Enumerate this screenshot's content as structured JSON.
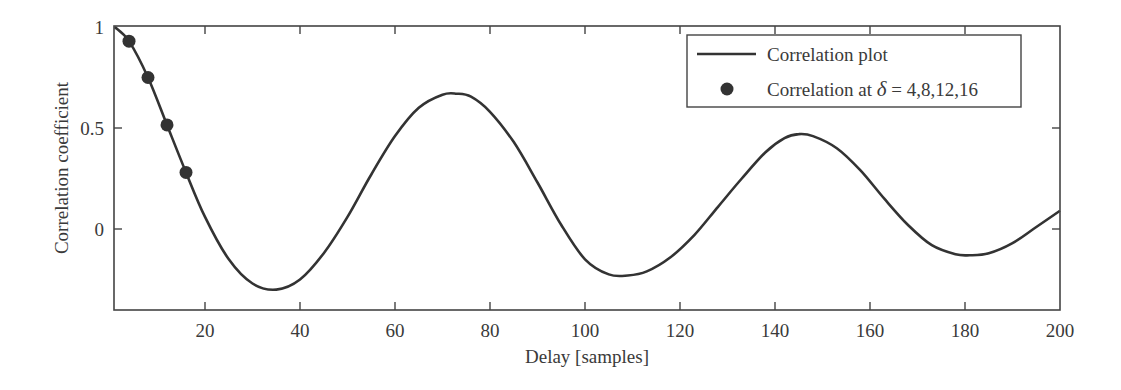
{
  "chart_data": {
    "type": "line",
    "title": "",
    "xlabel": "Delay [samples]",
    "ylabel": "Correlation coefficient",
    "xlim": [
      1,
      200
    ],
    "ylim": [
      -0.4,
      1.0
    ],
    "xticks": [
      20,
      40,
      60,
      80,
      100,
      120,
      140,
      160,
      180,
      200
    ],
    "xtick_labels": [
      "20",
      "40",
      "60",
      "80",
      "100",
      "120",
      "140",
      "160",
      "180",
      "200"
    ],
    "yticks": [
      0,
      0.5,
      1
    ],
    "ytick_labels": [
      "0",
      "0.5",
      "1"
    ],
    "grid": false,
    "legend_position": "upper right",
    "series": [
      {
        "name": "Correlation plot",
        "style": "line",
        "color": "#333333",
        "x": [
          1,
          4,
          8,
          12,
          16,
          20,
          25,
          30,
          35,
          40,
          45,
          50,
          55,
          60,
          65,
          70,
          73,
          76,
          80,
          85,
          90,
          95,
          100,
          105,
          109,
          113,
          118,
          123,
          128,
          133,
          138,
          142,
          145,
          148,
          153,
          158,
          163,
          168,
          173,
          178,
          181,
          185,
          190,
          195,
          200
        ],
        "y": [
          1.0,
          0.93,
          0.75,
          0.515,
          0.28,
          0.06,
          -0.15,
          -0.27,
          -0.3,
          -0.25,
          -0.12,
          0.06,
          0.27,
          0.46,
          0.6,
          0.665,
          0.67,
          0.655,
          0.58,
          0.43,
          0.23,
          0.02,
          -0.15,
          -0.225,
          -0.23,
          -0.21,
          -0.14,
          -0.03,
          0.11,
          0.25,
          0.38,
          0.45,
          0.47,
          0.46,
          0.4,
          0.29,
          0.15,
          0.02,
          -0.08,
          -0.125,
          -0.13,
          -0.12,
          -0.07,
          0.01,
          0.09
        ]
      },
      {
        "name": "Correlation at δ = 4,8,12,16",
        "style": "markers",
        "color": "#333333",
        "x": [
          4,
          8,
          12,
          16
        ],
        "y": [
          0.93,
          0.75,
          0.515,
          0.28
        ]
      }
    ]
  },
  "legend": {
    "line_label": "Correlation plot",
    "marker_label_prefix": "Correlation at ",
    "marker_label_symbol": "δ",
    "marker_label_suffix": " = 4,8,12,16"
  },
  "axes": {
    "xlabel": "Delay [samples]",
    "ylabel": "Correlation coefficient"
  }
}
